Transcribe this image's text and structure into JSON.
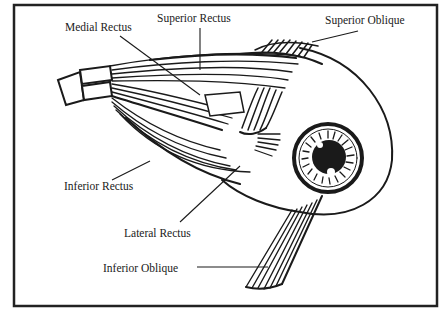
{
  "diagram": {
    "frame": {
      "x": 14,
      "y": 5,
      "width": 423,
      "height": 301,
      "stroke": "#222222"
    },
    "colors": {
      "ink": "#1a1a1a",
      "paper": "#ffffff"
    },
    "labels": [
      {
        "id": "medial-rectus",
        "text": "Medial Rectus",
        "x": 65,
        "y": 31,
        "leader": [
          120,
          36,
          200,
          95
        ]
      },
      {
        "id": "superior-rectus",
        "text": "Superior Rectus",
        "x": 157,
        "y": 22,
        "leader": [
          200,
          28,
          200,
          70
        ]
      },
      {
        "id": "superior-oblique",
        "text": "Superior Oblique",
        "x": 325,
        "y": 24,
        "leader": [
          358,
          31,
          312,
          42
        ]
      },
      {
        "id": "inferior-rectus",
        "text": "Inferior Rectus",
        "x": 64,
        "y": 190,
        "leader": [
          112,
          180,
          150,
          161
        ]
      },
      {
        "id": "lateral-rectus",
        "text": "Lateral Rectus",
        "x": 124,
        "y": 237,
        "leader": [
          180,
          222,
          240,
          166
        ]
      },
      {
        "id": "inferior-oblique",
        "text": "Inferior Oblique",
        "x": 103,
        "y": 272,
        "leader": [
          197,
          267,
          268,
          267
        ]
      }
    ]
  }
}
